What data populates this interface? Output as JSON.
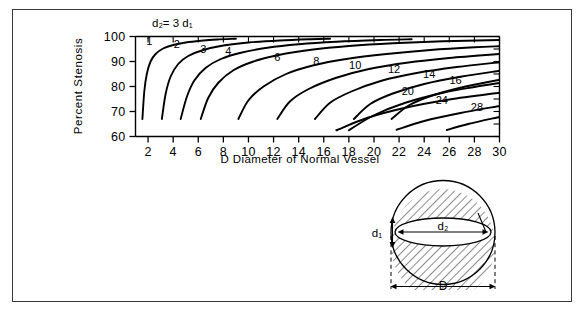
{
  "figure": {
    "annotation": "d₂= 3 d₁",
    "annotation_plain": "d2 = 3 d1"
  },
  "chart_data": {
    "type": "line",
    "title": "",
    "xlabel": "D  Diameter of Normal Vessel",
    "ylabel": "Percent Stenosis",
    "annotation": "d₂= 3 d₁",
    "xlim": [
      1,
      30
    ],
    "ylim": [
      60,
      100
    ],
    "grid": false,
    "legend": "inline-curve-labels",
    "xticks": [
      2,
      4,
      6,
      8,
      10,
      12,
      14,
      16,
      18,
      20,
      22,
      24,
      26,
      28,
      30
    ],
    "xticklabels": [
      "2",
      "4",
      "6",
      "8",
      "10",
      "12",
      "14",
      "16",
      "18",
      "20",
      "22",
      "24",
      "26",
      "28",
      "30"
    ],
    "yticks": [
      60,
      70,
      80,
      90,
      100
    ],
    "yticklabels": [
      "60",
      "70",
      "80",
      "90",
      "100"
    ],
    "series": [
      {
        "name": "1",
        "label": "1",
        "label_x": 2.1,
        "label_y": 96.5,
        "points": [
          [
            1.55,
            67
          ],
          [
            1.7,
            78
          ],
          [
            1.9,
            85
          ],
          [
            2.2,
            90
          ],
          [
            2.6,
            93
          ],
          [
            3.2,
            95.2
          ],
          [
            4.0,
            96.6
          ],
          [
            5.0,
            97.6
          ],
          [
            6.2,
            98.3
          ],
          [
            7.5,
            98.8
          ],
          [
            9.0,
            99.1
          ]
        ]
      },
      {
        "name": "2",
        "label": "2",
        "label_x": 4.3,
        "label_y": 95.5,
        "points": [
          [
            3.1,
            67
          ],
          [
            3.4,
            77
          ],
          [
            3.8,
            84
          ],
          [
            4.4,
            89
          ],
          [
            5.2,
            92.2
          ],
          [
            6.4,
            94.6
          ],
          [
            8.0,
            96.4
          ],
          [
            10.0,
            97.6
          ],
          [
            12.5,
            98.4
          ],
          [
            15.0,
            98.9
          ],
          [
            16.5,
            99.1
          ]
        ]
      },
      {
        "name": "3",
        "label": "3",
        "label_x": 6.4,
        "label_y": 93.3,
        "points": [
          [
            4.6,
            67
          ],
          [
            5.1,
            76
          ],
          [
            5.7,
            82.5
          ],
          [
            6.6,
            87.5
          ],
          [
            7.8,
            91
          ],
          [
            9.4,
            93.5
          ],
          [
            11.5,
            95.5
          ],
          [
            14.0,
            96.9
          ],
          [
            17.0,
            97.9
          ],
          [
            20.5,
            98.6
          ],
          [
            23.0,
            98.9
          ]
        ]
      },
      {
        "name": "4",
        "label": "4",
        "label_x": 8.4,
        "label_y": 92.6,
        "points": [
          [
            6.2,
            67
          ],
          [
            6.8,
            75.5
          ],
          [
            7.6,
            81.5
          ],
          [
            8.8,
            86.5
          ],
          [
            10.4,
            90
          ],
          [
            12.4,
            92.6
          ],
          [
            15.0,
            94.7
          ],
          [
            18.0,
            96.2
          ],
          [
            21.5,
            97.3
          ],
          [
            25.5,
            98.1
          ],
          [
            30,
            98.6
          ]
        ]
      },
      {
        "name": "6",
        "label": "6",
        "label_x": 12.3,
        "label_y": 90.3,
        "points": [
          [
            9.2,
            67
          ],
          [
            10.0,
            74.5
          ],
          [
            11.2,
            80
          ],
          [
            13.0,
            85
          ],
          [
            15.2,
            88.5
          ],
          [
            17.8,
            91
          ],
          [
            21.0,
            93
          ],
          [
            24.5,
            94.6
          ],
          [
            28.0,
            95.7
          ],
          [
            30,
            96.1
          ]
        ]
      },
      {
        "name": "8",
        "label": "8",
        "label_x": 15.4,
        "label_y": 88.7,
        "points": [
          [
            12.3,
            67
          ],
          [
            13.3,
            74
          ],
          [
            14.8,
            79
          ],
          [
            17.0,
            83.5
          ],
          [
            19.6,
            87
          ],
          [
            22.6,
            89.5
          ],
          [
            26.0,
            91.4
          ],
          [
            30,
            93.0
          ]
        ]
      },
      {
        "name": "10",
        "label": "10",
        "label_x": 18.5,
        "label_y": 87.0,
        "points": [
          [
            15.3,
            67
          ],
          [
            16.5,
            73.5
          ],
          [
            18.2,
            78
          ],
          [
            20.6,
            82.3
          ],
          [
            23.4,
            85.4
          ],
          [
            26.6,
            87.8
          ],
          [
            30,
            89.7
          ]
        ]
      },
      {
        "name": "12",
        "label": "12",
        "label_x": 21.6,
        "label_y": 85.3,
        "points": [
          [
            18.4,
            67
          ],
          [
            19.7,
            73
          ],
          [
            21.5,
            77.2
          ],
          [
            24.0,
            81
          ],
          [
            27.0,
            84
          ],
          [
            30,
            86.3
          ]
        ]
      },
      {
        "name": "14",
        "label": "14",
        "label_x": 24.4,
        "label_y": 83.3,
        "points": [
          [
            21.4,
            67
          ],
          [
            22.8,
            72.5
          ],
          [
            24.7,
            76.5
          ],
          [
            27.3,
            80
          ],
          [
            30,
            82.7
          ]
        ]
      },
      {
        "name": "16",
        "label": "16",
        "label_x": 26.5,
        "label_y": 81.0,
        "points": [
          [
            18.0,
            62.5
          ],
          [
            20.0,
            68.5
          ],
          [
            22.5,
            73.5
          ],
          [
            25.5,
            77.5
          ],
          [
            28.0,
            79.8
          ],
          [
            30,
            81.4
          ]
        ]
      },
      {
        "name": "20",
        "label": "20",
        "label_x": 22.7,
        "label_y": 76.5,
        "points": [
          [
            17.0,
            62.5
          ],
          [
            19.5,
            67.5
          ],
          [
            22.5,
            71.5
          ],
          [
            26.0,
            74.8
          ],
          [
            30,
            77.5
          ]
        ]
      },
      {
        "name": "24",
        "label": "24",
        "label_x": 25.4,
        "label_y": 73.2,
        "points": [
          [
            21.8,
            62.7
          ],
          [
            24.0,
            66.2
          ],
          [
            26.8,
            69.3
          ],
          [
            30,
            72.2
          ]
        ]
      },
      {
        "name": "28",
        "label": "28",
        "label_x": 28.2,
        "label_y": 70.3,
        "points": [
          [
            25.8,
            62.6
          ],
          [
            27.5,
            65.0
          ],
          [
            30,
            67.8
          ]
        ]
      }
    ]
  },
  "diagram": {
    "name": "vessel-cross-section",
    "labels": {
      "d1": "d₁",
      "d2": "d₂",
      "D": "D"
    }
  }
}
